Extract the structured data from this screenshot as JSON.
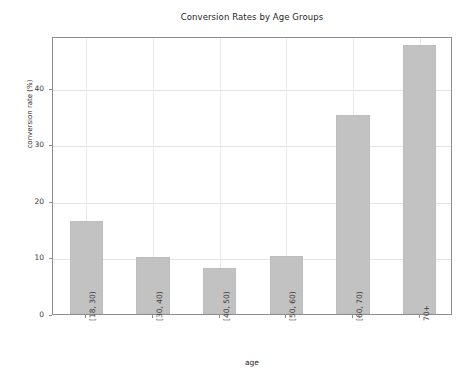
{
  "chart_data": {
    "type": "bar",
    "title": "Conversion Rates by Age Groups",
    "xlabel": "age",
    "ylabel": "conversion rate (%)",
    "categories": [
      "[18, 30)",
      "[30, 40)",
      "[40, 50)",
      "[50, 60)",
      "[60, 70)",
      "70+"
    ],
    "values": [
      16.5,
      10.1,
      8.1,
      10.2,
      35.3,
      47.6
    ],
    "ylim": [
      0,
      49.2
    ],
    "yticks": [
      0,
      10,
      20,
      30,
      40
    ],
    "ytick_labels": [
      "0",
      "10",
      "20",
      "30",
      "40"
    ],
    "grid": true,
    "legend": null,
    "bar_color": "#c2c2c2",
    "grid_color": "#e4e4e4",
    "axis_color": "#8d8d8d",
    "text_color": "#262626"
  }
}
